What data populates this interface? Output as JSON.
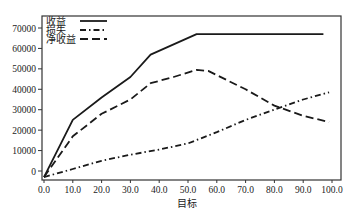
{
  "chart_data": {
    "type": "line",
    "title": "",
    "xlabel": "目标",
    "ylabel": "",
    "xlim": [
      0,
      100
    ],
    "ylim": [
      -3000,
      75000
    ],
    "grid": false,
    "legend_position": "upper left",
    "x_ticks": [
      "0.0",
      "10.0",
      "20.0",
      "30.0",
      "40.0",
      "50.0",
      "60.0",
      "70.0",
      "80.0",
      "90.0",
      "100.0"
    ],
    "y_ticks": [
      "0",
      "10000",
      "20000",
      "30000",
      "40000",
      "50000",
      "60000",
      "70000"
    ],
    "series": [
      {
        "name": "收益",
        "style": "solid",
        "points": [
          [
            0,
            -3000
          ],
          [
            10,
            25000
          ],
          [
            20,
            36000
          ],
          [
            30,
            46000
          ],
          [
            37,
            57000
          ],
          [
            53,
            67000
          ],
          [
            97,
            67000
          ]
        ]
      },
      {
        "name": "损失",
        "style": "dashdot",
        "points": [
          [
            0,
            -3000
          ],
          [
            10,
            1000
          ],
          [
            20,
            5000
          ],
          [
            30,
            8000
          ],
          [
            40,
            10500
          ],
          [
            50,
            13500
          ],
          [
            60,
            19000
          ],
          [
            70,
            25000
          ],
          [
            80,
            30000
          ],
          [
            90,
            35000
          ],
          [
            99,
            38500
          ]
        ]
      },
      {
        "name": "净收益",
        "style": "dashed",
        "points": [
          [
            0,
            -3000
          ],
          [
            10,
            17000
          ],
          [
            20,
            28000
          ],
          [
            30,
            35000
          ],
          [
            37,
            43000
          ],
          [
            45,
            46000
          ],
          [
            53,
            49500
          ],
          [
            57,
            49000
          ],
          [
            70,
            40000
          ],
          [
            80,
            32000
          ],
          [
            90,
            27000
          ],
          [
            99,
            24000
          ]
        ]
      }
    ]
  },
  "legend": {
    "items": [
      {
        "label": "收益"
      },
      {
        "label": "损失"
      },
      {
        "label": "净收益"
      }
    ]
  },
  "axis": {
    "x_title": "目标"
  }
}
